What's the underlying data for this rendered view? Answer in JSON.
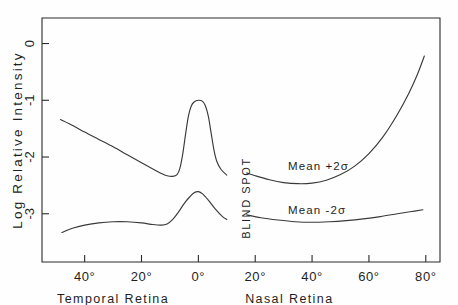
{
  "figure": {
    "background_color": "#fefefe",
    "ink_color": "#2b2b2b",
    "curve_color": "#3a3a3a"
  },
  "chart_data": {
    "type": "line",
    "title": "",
    "xlabel": "",
    "ylabel": "Log Relative Intensity",
    "grid": false,
    "legend": "none",
    "xlim": [
      -55,
      85
    ],
    "ylim": [
      -3.85,
      0.45
    ],
    "y_tick_values": [
      0,
      -1,
      -2,
      -3
    ],
    "y_tick_labels": [
      "0",
      "-1",
      "-2",
      "-3"
    ],
    "x_tick_values": [
      -40,
      -20,
      0,
      20,
      40,
      60,
      80
    ],
    "x_tick_labels": [
      "40°",
      "20°",
      "0°",
      "20°",
      "40°",
      "60°",
      "80°"
    ],
    "x_region_labels": [
      {
        "text": "Temporal  Retina",
        "center_deg": -30
      },
      {
        "text": "Nasal  Retina",
        "center_deg": 32
      }
    ],
    "blind_spot": {
      "label": "BLIND SPOT",
      "start_deg": 10,
      "end_deg": 17
    },
    "series": [
      {
        "name": "Mean +2σ",
        "annotation": "Mean  +2σ",
        "points_temporal": [
          {
            "x": -48.5,
            "y": -1.34
          },
          {
            "x": -44.0,
            "y": -1.45
          },
          {
            "x": -40.0,
            "y": -1.56
          },
          {
            "x": -35.0,
            "y": -1.69
          },
          {
            "x": -30.0,
            "y": -1.82
          },
          {
            "x": -25.0,
            "y": -1.96
          },
          {
            "x": -20.0,
            "y": -2.1
          },
          {
            "x": -16.0,
            "y": -2.21
          },
          {
            "x": -13.0,
            "y": -2.29
          },
          {
            "x": -11.0,
            "y": -2.33
          },
          {
            "x": -9.0,
            "y": -2.34
          },
          {
            "x": -7.5,
            "y": -2.31
          },
          {
            "x": -6.5,
            "y": -2.2
          },
          {
            "x": -5.5,
            "y": -1.95
          },
          {
            "x": -4.5,
            "y": -1.6
          },
          {
            "x": -3.5,
            "y": -1.28
          },
          {
            "x": -2.5,
            "y": -1.1
          },
          {
            "x": -1.5,
            "y": -1.03
          },
          {
            "x": 0.0,
            "y": -1.0
          },
          {
            "x": 1.5,
            "y": -1.02
          },
          {
            "x": 2.5,
            "y": -1.1
          },
          {
            "x": 3.5,
            "y": -1.28
          },
          {
            "x": 4.5,
            "y": -1.58
          },
          {
            "x": 5.5,
            "y": -1.88
          },
          {
            "x": 6.5,
            "y": -2.08
          },
          {
            "x": 8.0,
            "y": -2.22
          },
          {
            "x": 10.0,
            "y": -2.32
          }
        ],
        "points_nasal": [
          {
            "x": 17.0,
            "y": -2.28
          },
          {
            "x": 20.0,
            "y": -2.33
          },
          {
            "x": 25.0,
            "y": -2.4
          },
          {
            "x": 30.0,
            "y": -2.45
          },
          {
            "x": 35.0,
            "y": -2.47
          },
          {
            "x": 40.0,
            "y": -2.46
          },
          {
            "x": 45.0,
            "y": -2.41
          },
          {
            "x": 50.0,
            "y": -2.31
          },
          {
            "x": 55.0,
            "y": -2.16
          },
          {
            "x": 60.0,
            "y": -1.94
          },
          {
            "x": 65.0,
            "y": -1.64
          },
          {
            "x": 70.0,
            "y": -1.25
          },
          {
            "x": 74.0,
            "y": -0.88
          },
          {
            "x": 77.0,
            "y": -0.55
          },
          {
            "x": 79.5,
            "y": -0.22
          }
        ]
      },
      {
        "name": "Mean -2σ",
        "annotation": "Mean  -2σ",
        "points_temporal": [
          {
            "x": -48.0,
            "y": -3.33
          },
          {
            "x": -44.0,
            "y": -3.25
          },
          {
            "x": -40.0,
            "y": -3.2
          },
          {
            "x": -35.0,
            "y": -3.16
          },
          {
            "x": -30.0,
            "y": -3.14
          },
          {
            "x": -25.0,
            "y": -3.14
          },
          {
            "x": -20.0,
            "y": -3.16
          },
          {
            "x": -16.0,
            "y": -3.19
          },
          {
            "x": -13.0,
            "y": -3.2
          },
          {
            "x": -11.0,
            "y": -3.18
          },
          {
            "x": -9.0,
            "y": -3.1
          },
          {
            "x": -7.0,
            "y": -2.97
          },
          {
            "x": -5.0,
            "y": -2.82
          },
          {
            "x": -3.0,
            "y": -2.7
          },
          {
            "x": -1.5,
            "y": -2.63
          },
          {
            "x": 0.0,
            "y": -2.61
          },
          {
            "x": 1.5,
            "y": -2.65
          },
          {
            "x": 3.5,
            "y": -2.76
          },
          {
            "x": 6.0,
            "y": -2.92
          },
          {
            "x": 8.5,
            "y": -3.05
          },
          {
            "x": 10.0,
            "y": -3.1
          }
        ],
        "points_nasal": [
          {
            "x": 17.0,
            "y": -3.02
          },
          {
            "x": 22.0,
            "y": -3.07
          },
          {
            "x": 28.0,
            "y": -3.11
          },
          {
            "x": 34.0,
            "y": -3.14
          },
          {
            "x": 40.0,
            "y": -3.15
          },
          {
            "x": 46.0,
            "y": -3.14
          },
          {
            "x": 52.0,
            "y": -3.12
          },
          {
            "x": 58.0,
            "y": -3.09
          },
          {
            "x": 64.0,
            "y": -3.05
          },
          {
            "x": 70.0,
            "y": -3.0
          },
          {
            "x": 75.0,
            "y": -2.96
          },
          {
            "x": 79.0,
            "y": -2.93
          }
        ]
      }
    ]
  }
}
